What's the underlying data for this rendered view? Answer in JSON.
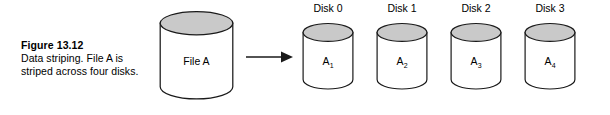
{
  "figure": {
    "number": "Figure 13.12",
    "caption": "Data striping. File A is striped across four disks."
  },
  "source_disk": {
    "label": "File A",
    "icon": "cylinder-icon"
  },
  "arrow": {
    "icon": "arrow-right-icon",
    "direction": "right"
  },
  "disks": [
    {
      "title": "Disk 0",
      "stripe": "A",
      "subscript": "1",
      "icon": "cylinder-icon"
    },
    {
      "title": "Disk 1",
      "stripe": "A",
      "subscript": "2",
      "icon": "cylinder-icon"
    },
    {
      "title": "Disk 2",
      "stripe": "A",
      "subscript": "3",
      "icon": "cylinder-icon"
    },
    {
      "title": "Disk 3",
      "stripe": "A",
      "subscript": "4",
      "icon": "cylinder-icon"
    }
  ],
  "colors": {
    "stroke": "#1a1a1a",
    "cylinder_top_fill": "#c9c9c9",
    "cylinder_body_fill": "#ffffff",
    "background": "#ffffff",
    "rule": "#4a4a4a"
  }
}
